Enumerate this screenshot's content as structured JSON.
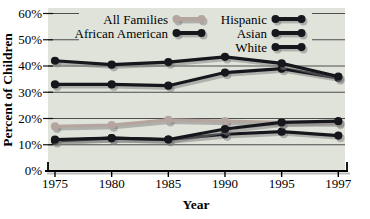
{
  "chart_data": {
    "type": "line",
    "title": "",
    "xlabel": "Year",
    "ylabel": "Percent of Children",
    "categories": [
      "1975",
      "1980",
      "1985",
      "1990",
      "1995",
      "1997"
    ],
    "y_tick_labels": [
      "0%",
      "10%",
      "20%",
      "30%",
      "40%",
      "50%",
      "60%"
    ],
    "ylim": [
      0,
      62
    ],
    "grid": "horizontal",
    "legend_position": "top-inside-two-columns",
    "series": [
      {
        "name": "All Families",
        "color": "#b4a69e",
        "legend_column": 1,
        "values": [
          17,
          17.5,
          19.5,
          19,
          18.5,
          18.5
        ]
      },
      {
        "name": "African American",
        "color": "#16161d",
        "legend_column": 1,
        "values": [
          42,
          40.5,
          41.5,
          43.5,
          41,
          36
        ]
      },
      {
        "name": "Hispanic",
        "color": "#16161d",
        "legend_column": 2,
        "values": [
          33,
          33,
          32.5,
          37.5,
          39,
          35.5
        ]
      },
      {
        "name": "Asian",
        "color": "#16161d",
        "legend_column": 2,
        "values": [
          12,
          12.5,
          12,
          16,
          18.5,
          19
        ]
      },
      {
        "name": "White",
        "color": "#16161d",
        "legend_column": 2,
        "values": [
          11.5,
          12.5,
          12,
          14,
          15,
          13.5
        ]
      }
    ],
    "colors": {
      "plot_bg": "#e0e3da",
      "grid": "#3c3c3c",
      "axis": "#000000",
      "shadow": "rgba(125,125,125,0.5)"
    }
  }
}
